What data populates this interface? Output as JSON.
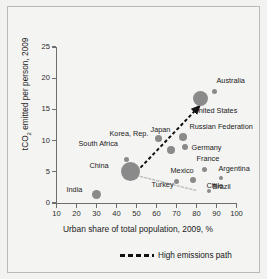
{
  "chart_data": {
    "type": "scatter",
    "title": "",
    "xlabel": "Urban share of total population, 2009, %",
    "ylabel": "tCO2 emitted per person, 2009",
    "ylabel_pre": "tCO",
    "ylabel_sub": "2",
    "ylabel_post": " emitted per person, 2009",
    "xlim": [
      10,
      100
    ],
    "ylim": [
      0,
      25
    ],
    "xticks": [
      10,
      20,
      30,
      40,
      50,
      60,
      70,
      80,
      90,
      100
    ],
    "yticks": [
      0,
      5,
      10,
      15,
      20,
      25
    ],
    "grid": false,
    "legend_position": "bottom-right",
    "bubble_meaning": "population size",
    "points": [
      {
        "name": "India",
        "x": 30,
        "y": 1.4,
        "size": 9,
        "label_dx": -30,
        "label_dy": -4
      },
      {
        "name": "China",
        "x": 47,
        "y": 5.1,
        "size": 19,
        "label_dx": -41,
        "label_dy": -5
      },
      {
        "name": "South Africa",
        "x": 45,
        "y": 6.9,
        "size": 5,
        "label_dx": -48,
        "label_dy": -16
      },
      {
        "name": "Korea, Rep.",
        "x": 61,
        "y": 10.4,
        "size": 7,
        "label_dx": -49,
        "label_dy": -4
      },
      {
        "name": "Japan",
        "x": 67,
        "y": 8.5,
        "size": 8,
        "label_dx": -20,
        "label_dy": -20
      },
      {
        "name": "Russian Federation",
        "x": 73,
        "y": 10.6,
        "size": 8,
        "label_dx": 7,
        "label_dy": -10
      },
      {
        "name": "Germany",
        "x": 74,
        "y": 8.9,
        "size": 6,
        "label_dx": 7,
        "label_dy": 1
      },
      {
        "name": "United States",
        "x": 82,
        "y": 16.7,
        "size": 15,
        "label_dx": -7,
        "label_dy": 12
      },
      {
        "name": "Australia",
        "x": 89,
        "y": 17.8,
        "size": 5,
        "label_dx": 2,
        "label_dy": -11
      },
      {
        "name": "France",
        "x": 84,
        "y": 5.3,
        "size": 5,
        "label_dx": -8,
        "label_dy": -11
      },
      {
        "name": "Mexico",
        "x": 78,
        "y": 3.7,
        "size": 6,
        "label_dx": -22,
        "label_dy": -9
      },
      {
        "name": "Turkey",
        "x": 70,
        "y": 3.4,
        "size": 5,
        "label_dx": -25,
        "label_dy": 3
      },
      {
        "name": "Argentina",
        "x": 92,
        "y": 4.0,
        "size": 4,
        "label_dx": -2,
        "label_dy": -9
      },
      {
        "name": "Chile",
        "x": 89,
        "y": 3.0,
        "size": 3,
        "label_dx": -8,
        "label_dy": 2
      },
      {
        "name": "Brazil",
        "x": 86,
        "y": 1.9,
        "size": 4,
        "label_dx": 4,
        "label_dy": -4
      }
    ],
    "annotations": [
      {
        "type": "arrow",
        "name": "high-emissions-path",
        "style": "black-dashed",
        "from": [
          50,
          5.0
        ],
        "to": [
          80.5,
          15.2
        ]
      },
      {
        "type": "path",
        "name": "low-emissions-path",
        "style": "gray-dotted",
        "from": [
          50,
          4.4
        ],
        "to": [
          80,
          2.0
        ]
      }
    ],
    "legend": [
      {
        "label": "High emissions path",
        "style": "black-dashed"
      }
    ]
  },
  "legend": {
    "dash_label": "High emissions path"
  },
  "colors": {
    "background": "#f2f2f0",
    "bubble": "#8a8a8a",
    "axis": "#6e6e6e",
    "text": "#1b1b1b",
    "arrow": "#111111",
    "gray_path": "#c0c0bd"
  }
}
